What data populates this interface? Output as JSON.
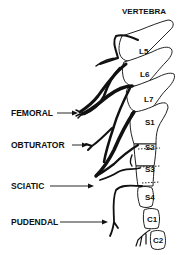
{
  "diagram": {
    "title": "VERTEBRA",
    "vertebrae": [
      "L5",
      "L6",
      "L7",
      "S1",
      "S2",
      "S3",
      "S4",
      "C1",
      "C2"
    ],
    "nerves": [
      "FEMORAL",
      "OBTURATOR",
      "SCIATIC",
      "PUDENDAL"
    ],
    "colors": {
      "ink": "#111111",
      "background": "#ffffff"
    }
  }
}
